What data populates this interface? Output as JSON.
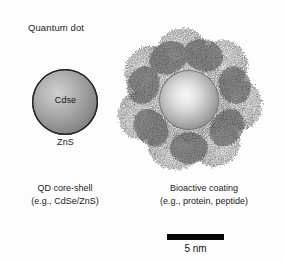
{
  "figure": {
    "background_color": "#ffffff",
    "ink_color": "#1c1c1c",
    "title_label": "Quantum dot"
  },
  "quantum_dot": {
    "label": "Quantum dot",
    "core_label": "Cdse",
    "shell_label": "ZnS",
    "caption_line1": "QD core-shell",
    "caption_line2": "(e.g., CdSe/ZnS)",
    "core_color": "#c7c7c7",
    "shell_color": "#7a7a7a",
    "outline_color": "#262626"
  },
  "bioconjugate": {
    "caption_line1": "Bioactive coating",
    "caption_line2": "(e.g., protein, peptide)",
    "inner_sphere_color": "#e9e9e9",
    "coating_color": "#5c5c5c",
    "coating_lobes": 7
  },
  "scale": {
    "label": "5 nm",
    "bar_length_px": 57,
    "bar_color": "#070707"
  }
}
